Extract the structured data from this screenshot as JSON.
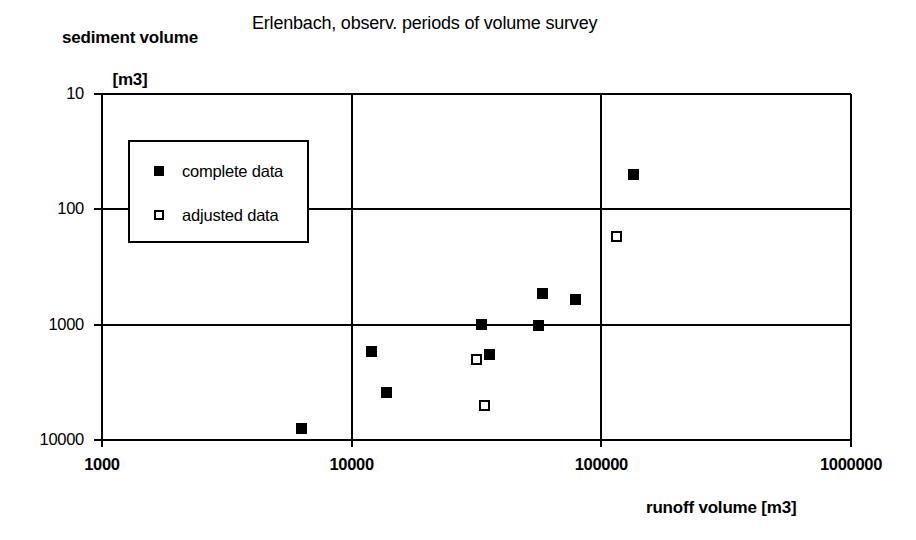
{
  "titles": {
    "chart_title": "Erlenbach, observ. periods of volume survey",
    "y_axis_line1": "sediment volume",
    "y_axis_line2": "[m3]",
    "x_axis": "runoff volume [m3]"
  },
  "legend": {
    "items": [
      {
        "label": "complete data",
        "marker": "filled-square"
      },
      {
        "label": "adjusted data",
        "marker": "open-square"
      }
    ]
  },
  "axes": {
    "y_ticks": [
      "10000",
      "1000",
      "100",
      "10"
    ],
    "x_ticks": [
      "1000",
      "10000",
      "100000",
      "1000000"
    ]
  },
  "colors": {
    "ink": "#000000",
    "background": "#ffffff"
  },
  "chart_data": {
    "type": "scatter",
    "title": "Erlenbach, observ. periods of volume survey",
    "xlabel": "runoff volume [m3]",
    "ylabel": "sediment volume [m3]",
    "xscale": "log",
    "yscale": "log",
    "xlim": [
      1000,
      1000000
    ],
    "ylim": [
      10,
      10000
    ],
    "xticks": [
      1000,
      10000,
      100000,
      1000000
    ],
    "yticks": [
      10,
      100,
      1000,
      10000
    ],
    "grid": true,
    "legend_position": "upper-left-inside",
    "series": [
      {
        "name": "complete data",
        "marker": "filled-square",
        "points": [
          {
            "x": 6300,
            "y": 12.5
          },
          {
            "x": 12000,
            "y": 58
          },
          {
            "x": 13800,
            "y": 26
          },
          {
            "x": 33000,
            "y": 100
          },
          {
            "x": 35500,
            "y": 55
          },
          {
            "x": 56000,
            "y": 98
          },
          {
            "x": 58000,
            "y": 185
          },
          {
            "x": 79000,
            "y": 165
          },
          {
            "x": 135000,
            "y": 2000
          }
        ]
      },
      {
        "name": "adjusted data",
        "marker": "open-square",
        "points": [
          {
            "x": 31500,
            "y": 50
          },
          {
            "x": 34000,
            "y": 20
          },
          {
            "x": 115000,
            "y": 580
          }
        ]
      }
    ]
  }
}
